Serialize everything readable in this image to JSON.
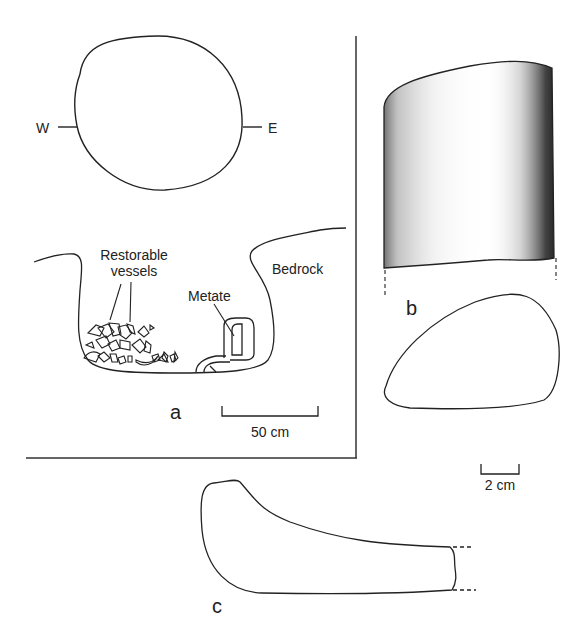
{
  "figure": {
    "panel_a": {
      "letter": "a",
      "plan": {
        "west_label": "W",
        "east_label": "E"
      },
      "section": {
        "label_vessels_line1": "Restorable",
        "label_vessels_line2": "vessels",
        "label_metate": "Metate",
        "label_bedrock": "Bedrock"
      },
      "scale_bar": {
        "label": "50 cm"
      }
    },
    "panel_b": {
      "letter": "b"
    },
    "panel_c": {
      "letter": "c"
    },
    "scale_bar_bc": {
      "label": "2 cm"
    },
    "colors": {
      "line": "#222222",
      "background": "#ffffff",
      "stipple": "#333333"
    }
  }
}
